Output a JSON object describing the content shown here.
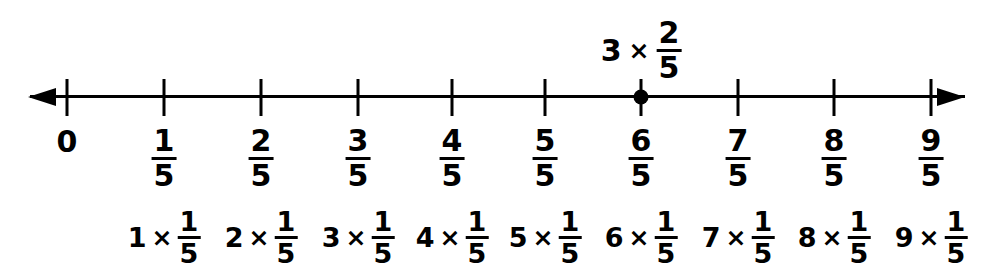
{
  "diagram": {
    "background_color": "#ffffff",
    "line_color": "#000000",
    "axis": {
      "left_arrow": "arrow-left-icon",
      "right_arrow": "arrow-right-icon"
    },
    "ticks": [
      {
        "x": 67,
        "label_type": "whole",
        "numerator": "0",
        "denominator": ""
      },
      {
        "x": 164,
        "label_type": "fraction",
        "numerator": "1",
        "denominator": "5"
      },
      {
        "x": 261,
        "label_type": "fraction",
        "numerator": "2",
        "denominator": "5"
      },
      {
        "x": 358,
        "label_type": "fraction",
        "numerator": "3",
        "denominator": "5"
      },
      {
        "x": 452,
        "label_type": "fraction",
        "numerator": "4",
        "denominator": "5"
      },
      {
        "x": 545,
        "label_type": "fraction",
        "numerator": "5",
        "denominator": "5"
      },
      {
        "x": 641,
        "label_type": "fraction",
        "numerator": "6",
        "denominator": "5"
      },
      {
        "x": 738,
        "label_type": "fraction",
        "numerator": "7",
        "denominator": "5"
      },
      {
        "x": 834,
        "label_type": "fraction",
        "numerator": "8",
        "denominator": "5"
      },
      {
        "x": 931,
        "label_type": "fraction",
        "numerator": "9",
        "denominator": "5"
      }
    ],
    "expressions": [
      {
        "x": 164,
        "multiplier": "1",
        "times": "×",
        "numerator": "1",
        "denominator": "5"
      },
      {
        "x": 261,
        "multiplier": "2",
        "times": "×",
        "numerator": "1",
        "denominator": "5"
      },
      {
        "x": 358,
        "multiplier": "3",
        "times": "×",
        "numerator": "1",
        "denominator": "5"
      },
      {
        "x": 452,
        "multiplier": "4",
        "times": "×",
        "numerator": "1",
        "denominator": "5"
      },
      {
        "x": 545,
        "multiplier": "5",
        "times": "×",
        "numerator": "1",
        "denominator": "5"
      },
      {
        "x": 641,
        "multiplier": "6",
        "times": "×",
        "numerator": "1",
        "denominator": "5"
      },
      {
        "x": 738,
        "multiplier": "7",
        "times": "×",
        "numerator": "1",
        "denominator": "5"
      },
      {
        "x": 834,
        "multiplier": "8",
        "times": "×",
        "numerator": "1",
        "denominator": "5"
      },
      {
        "x": 931,
        "multiplier": "9",
        "times": "×",
        "numerator": "1",
        "denominator": "5"
      }
    ],
    "marked_point": {
      "x": 641,
      "value_numerator": "6",
      "value_denominator": "5",
      "annotation": {
        "multiplier": "3",
        "times": "×",
        "numerator": "2",
        "denominator": "5"
      }
    }
  }
}
